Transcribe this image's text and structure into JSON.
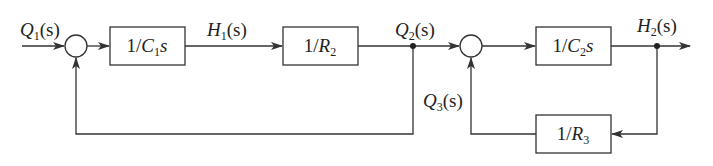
{
  "diagram": {
    "type": "block-diagram",
    "signals": {
      "q1": {
        "main": "Q",
        "sub": "1",
        "arg": "(s)"
      },
      "h1": {
        "main": "H",
        "sub": "1",
        "arg": "(s)"
      },
      "q2": {
        "main": "Q",
        "sub": "2",
        "arg": "(s)"
      },
      "q3": {
        "main": "Q",
        "sub": "3",
        "arg": "(s)"
      },
      "h2": {
        "main": "H",
        "sub": "2",
        "arg": "(s)"
      }
    },
    "blocks": {
      "b1": {
        "pre": "1/",
        "var": "C",
        "sub": "1",
        "post": "s"
      },
      "b2": {
        "pre": "1/",
        "var": "R",
        "sub": "2",
        "post": ""
      },
      "b3": {
        "pre": "1/",
        "var": "C",
        "sub": "2",
        "post": "s"
      },
      "b4": {
        "pre": "1/",
        "var": "R",
        "sub": "3",
        "post": ""
      }
    },
    "colors": {
      "line": "#333333",
      "background": "#ffffff"
    }
  }
}
